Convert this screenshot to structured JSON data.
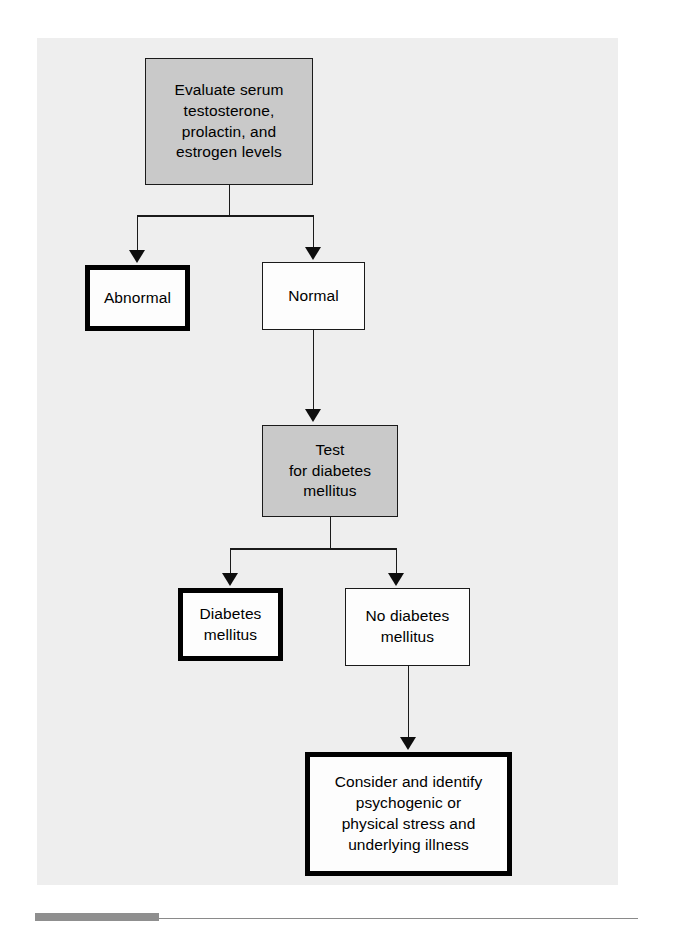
{
  "figure": {
    "type": "flowchart",
    "panel_background": "#eeeeee",
    "orientation": "top-down",
    "nodes": [
      {
        "id": "evaluate",
        "label": "Evaluate serum\ntestosterone,\nprolactin, and\nestrogen levels",
        "fill": "#c9c9c9",
        "border": "thin",
        "role": "process"
      },
      {
        "id": "abnormal",
        "label": "Abnormal",
        "fill": "#fdfdfd",
        "border": "thick",
        "role": "terminal-outcome"
      },
      {
        "id": "normal",
        "label": "Normal",
        "fill": "#fdfdfd",
        "border": "thin",
        "role": "outcome"
      },
      {
        "id": "test-diabetes",
        "label": "Test\nfor diabetes\nmellitus",
        "fill": "#c9c9c9",
        "border": "thin",
        "role": "process"
      },
      {
        "id": "diabetes",
        "label": "Diabetes\nmellitus",
        "fill": "#fdfdfd",
        "border": "thick",
        "role": "terminal-outcome"
      },
      {
        "id": "no-diabetes",
        "label": "No diabetes\nmellitus",
        "fill": "#fdfdfd",
        "border": "thin",
        "role": "outcome"
      },
      {
        "id": "consider",
        "label": "Consider and identify\npsychogenic or\nphysical stress and\nunderlying illness",
        "fill": "#fdfdfd",
        "border": "thick",
        "role": "terminal-outcome"
      }
    ],
    "edges": [
      {
        "from": "evaluate",
        "to": "abnormal",
        "arrow": true
      },
      {
        "from": "evaluate",
        "to": "normal",
        "arrow": true
      },
      {
        "from": "normal",
        "to": "test-diabetes",
        "arrow": true
      },
      {
        "from": "test-diabetes",
        "to": "diabetes",
        "arrow": true
      },
      {
        "from": "test-diabetes",
        "to": "no-diabetes",
        "arrow": true
      },
      {
        "from": "no-diabetes",
        "to": "consider",
        "arrow": true
      }
    ],
    "line_color": "#1a1a1a"
  }
}
